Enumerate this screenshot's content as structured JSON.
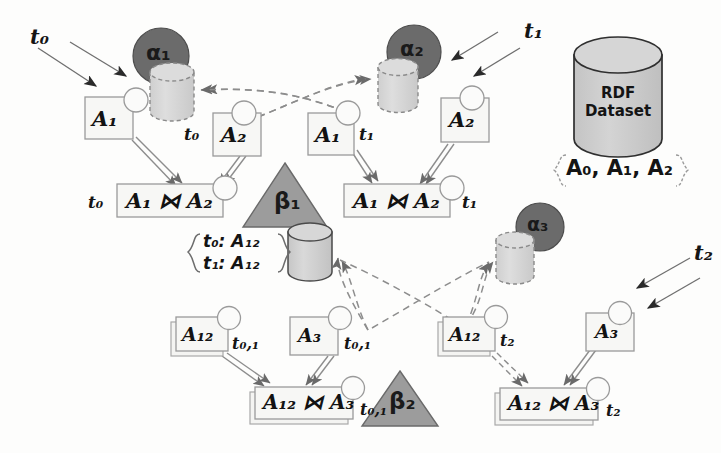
{
  "figure": {
    "background_color": "#fdfdfc",
    "colors": {
      "alpha_circle_fill": "#6b6b6b",
      "beta_triangle_fill": "#9c9c9c",
      "cylinder_dashed_fill": "#d8d8d8",
      "cylinder_solid_fill": "#d0d0d0",
      "dataset_fill": "#cfcfcf",
      "box_fill": "#f7f7f5",
      "stroke": "#5a5a5a",
      "dark_stroke": "#2a2a2a",
      "text": "#141414"
    }
  },
  "dataset": {
    "label_line1": "RDF",
    "label_line2": "Dataset",
    "contents": "A₀, A₁, A₂",
    "brace_left": "{",
    "brace_right": "}"
  },
  "operators": {
    "alpha1": "α₁",
    "alpha2": "α₂",
    "alpha3": "α₃",
    "beta1": "β₁",
    "beta2": "β₂"
  },
  "time_markers": {
    "t0": "t₀",
    "t1": "t₁",
    "t2": "t₂",
    "t01": "t₀,₁"
  },
  "boxes": [
    {
      "id": "a1-left-top",
      "text": "A₁",
      "time": "",
      "stacked": false
    },
    {
      "id": "a2-mid-top",
      "text": "A₂",
      "time": "t₀",
      "stacked": false
    },
    {
      "id": "a1-mid-top",
      "text": "A₁",
      "time": "t₁",
      "stacked": false
    },
    {
      "id": "a2-right-top",
      "text": "A₂",
      "time": "",
      "stacked": false
    },
    {
      "id": "join-left",
      "text": "A₁ ⋈ A₂",
      "time": "t₀",
      "stacked": false
    },
    {
      "id": "join-right",
      "text": "A₁ ⋈ A₂",
      "time": "t₁",
      "stacked": false
    },
    {
      "id": "a12-left-bot",
      "text": "A₁₂",
      "time": "t₀,₁",
      "stacked": true
    },
    {
      "id": "a3-left-bot",
      "text": "A₃",
      "time": "t₀,₁",
      "stacked": false
    },
    {
      "id": "a12-right-bot",
      "text": "A₁₂",
      "time": "t₂",
      "stacked": true
    },
    {
      "id": "a3-right-bot",
      "text": "A₃",
      "time": "",
      "stacked": false
    },
    {
      "id": "join-bot-left",
      "text": "A₁₂ ⋈ A₃",
      "time": "t₀,₁",
      "stacked": true
    },
    {
      "id": "join-bot-right",
      "text": "A₁₂ ⋈ A₃",
      "time": "t₂",
      "stacked": true
    }
  ],
  "set_note": {
    "brace_left": "{",
    "brace_right": "}",
    "line1": "t₀: A₁₂",
    "line2": "t₁: A₁₂"
  },
  "arrow_annotations": [
    {
      "label": "t₀",
      "position": "top-left"
    },
    {
      "label": "t₁",
      "position": "top-right"
    },
    {
      "label": "t₂",
      "position": "middle-right"
    }
  ]
}
